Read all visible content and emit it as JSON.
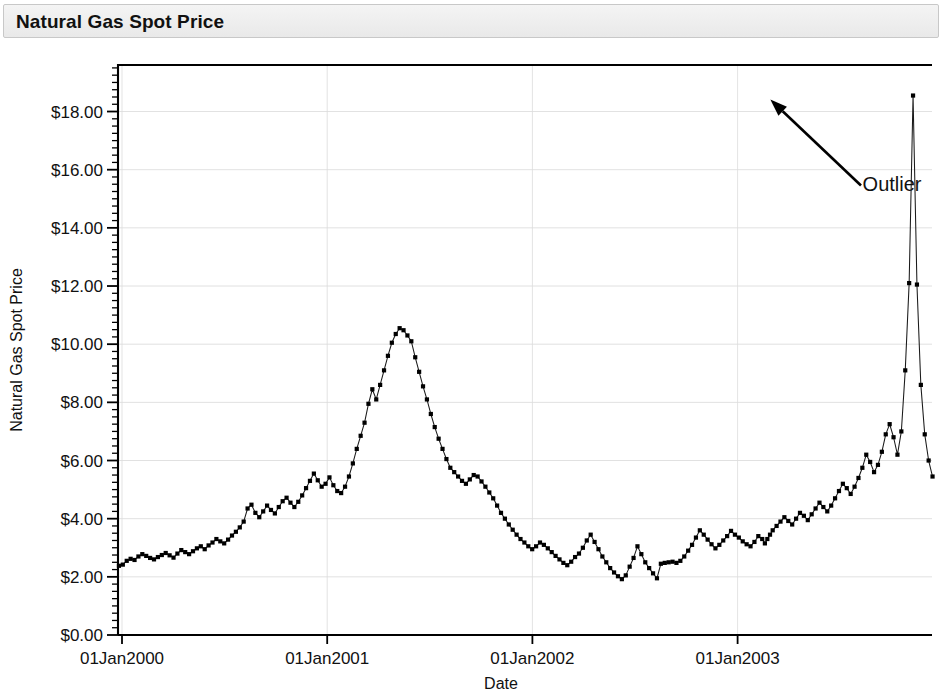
{
  "header": {
    "title": "Natural Gas Spot Price"
  },
  "chart_data": {
    "type": "line",
    "title": "Natural Gas Spot Price",
    "xlabel": "Date",
    "ylabel": "Natural Gas Spot Price",
    "grid": true,
    "legend": null,
    "marker": "square",
    "marker_color": "#000000",
    "line_color": "#1a1a1a",
    "ylim": [
      0.0,
      19.6
    ],
    "ytick_values": [
      0,
      2,
      4,
      6,
      8,
      10,
      12,
      14,
      16,
      18
    ],
    "ytick_labels": [
      "$0.00",
      "$2.00",
      "$4.00",
      "$6.00",
      "$8.00",
      "$10.00",
      "$12.00",
      "$14.00",
      "$16.00",
      "$18.00"
    ],
    "ytick_minor_step": 0.25,
    "xlim": [
      "1999-11-20",
      "2004-01-20"
    ],
    "xtick_labels": [
      "01Jan2000",
      "01Jan2001",
      "01Jan2002",
      "01Jan2003"
    ],
    "xtick_values": [
      2000.0,
      2001.0,
      2002.0,
      2003.0
    ],
    "annotations": [
      {
        "text": "Outlier",
        "points_to_x": 2003.145,
        "points_to_y": 18.55,
        "text_x": 2003.58,
        "text_y": 15.6
      }
    ],
    "x": [
      1999.89,
      1999.909,
      1999.928,
      1999.947,
      1999.966,
      1999.985,
      2000.004,
      2000.023,
      2000.042,
      2000.061,
      2000.08,
      2000.099,
      2000.118,
      2000.137,
      2000.156,
      2000.175,
      2000.194,
      2000.213,
      2000.232,
      2000.251,
      2000.27,
      2000.289,
      2000.308,
      2000.327,
      2000.346,
      2000.365,
      2000.384,
      2000.403,
      2000.422,
      2000.441,
      2000.46,
      2000.479,
      2000.498,
      2000.517,
      2000.536,
      2000.555,
      2000.574,
      2000.593,
      2000.612,
      2000.631,
      2000.65,
      2000.669,
      2000.688,
      2000.707,
      2000.726,
      2000.745,
      2000.764,
      2000.783,
      2000.802,
      2000.821,
      2000.84,
      2000.859,
      2000.878,
      2000.897,
      2000.916,
      2000.935,
      2000.954,
      2000.973,
      2000.992,
      2001.011,
      2001.03,
      2001.049,
      2001.068,
      2001.087,
      2001.106,
      2001.125,
      2001.144,
      2001.163,
      2001.182,
      2001.201,
      2001.22,
      2001.239,
      2001.258,
      2001.277,
      2001.296,
      2001.315,
      2001.334,
      2001.353,
      2001.372,
      2001.391,
      2001.41,
      2001.429,
      2001.448,
      2001.467,
      2001.486,
      2001.505,
      2001.524,
      2001.543,
      2001.562,
      2001.581,
      2001.6,
      2001.619,
      2001.638,
      2001.657,
      2001.676,
      2001.695,
      2001.714,
      2001.733,
      2001.752,
      2001.771,
      2001.79,
      2001.809,
      2001.828,
      2001.847,
      2001.866,
      2001.885,
      2001.904,
      2001.923,
      2001.942,
      2001.961,
      2001.98,
      2001.999,
      2002.018,
      2002.037,
      2002.056,
      2002.075,
      2002.094,
      2002.113,
      2002.132,
      2002.151,
      2002.17,
      2002.189,
      2002.208,
      2002.227,
      2002.246,
      2002.265,
      2002.284,
      2002.303,
      2002.322,
      2002.341,
      2002.36,
      2002.379,
      2002.398,
      2002.417,
      2002.436,
      2002.455,
      2002.474,
      2002.493,
      2002.512,
      2002.531,
      2002.55,
      2002.569,
      2002.588,
      2002.607,
      2002.626,
      2002.645,
      2002.664,
      2002.683,
      2002.702,
      2002.721,
      2002.74,
      2002.759,
      2002.778,
      2002.797,
      2002.816,
      2002.835,
      2002.854,
      2002.873,
      2002.892,
      2002.911,
      2002.93,
      2002.949,
      2002.968,
      2002.987,
      2003.006,
      2003.025,
      2003.044,
      2003.063,
      2003.082,
      2003.101,
      2003.12,
      2003.133,
      2003.145,
      2003.158,
      2003.171,
      2003.19,
      2003.209,
      2003.228,
      2003.247,
      2003.266,
      2003.285,
      2003.304,
      2003.323,
      2003.342,
      2003.361,
      2003.38,
      2003.399,
      2003.418,
      2003.437,
      2003.456,
      2003.475,
      2003.494,
      2003.513,
      2003.532,
      2003.551,
      2003.57,
      2003.589,
      2003.608,
      2003.627,
      2003.646,
      2003.665,
      2003.684,
      2003.703,
      2003.722,
      2003.741,
      2003.76,
      2003.779,
      2003.798,
      2003.817,
      2003.836,
      2003.855,
      2003.874,
      2003.893,
      2003.912,
      2003.931,
      2003.95,
      2003.969,
      2003.988,
      2004.007,
      2004.026,
      2004.045
    ],
    "y": [
      2.2,
      2.32,
      2.4,
      2.35,
      2.28,
      2.38,
      2.42,
      2.55,
      2.62,
      2.58,
      2.7,
      2.78,
      2.72,
      2.65,
      2.6,
      2.68,
      2.75,
      2.82,
      2.74,
      2.66,
      2.8,
      2.92,
      2.85,
      2.78,
      2.88,
      2.98,
      3.05,
      2.95,
      3.08,
      3.18,
      3.3,
      3.22,
      3.15,
      3.28,
      3.42,
      3.55,
      3.7,
      3.9,
      4.35,
      4.48,
      4.2,
      4.05,
      4.25,
      4.45,
      4.3,
      4.18,
      4.4,
      4.6,
      4.72,
      4.55,
      4.4,
      4.58,
      4.8,
      5.05,
      5.3,
      5.55,
      5.32,
      5.1,
      5.2,
      5.42,
      5.15,
      4.95,
      4.88,
      5.1,
      5.45,
      5.9,
      6.4,
      6.85,
      7.3,
      7.95,
      8.45,
      8.1,
      8.6,
      9.1,
      9.6,
      10.05,
      10.35,
      10.55,
      10.48,
      10.3,
      10.1,
      9.55,
      9.05,
      8.55,
      8.1,
      7.6,
      7.15,
      6.75,
      6.4,
      6.05,
      5.75,
      5.6,
      5.45,
      5.3,
      5.2,
      5.35,
      5.5,
      5.45,
      5.28,
      5.1,
      4.9,
      4.7,
      4.45,
      4.2,
      4.0,
      3.8,
      3.62,
      3.45,
      3.3,
      3.18,
      3.05,
      2.95,
      3.05,
      3.18,
      3.1,
      2.98,
      2.85,
      2.72,
      2.6,
      2.48,
      2.4,
      2.52,
      2.68,
      2.8,
      3.0,
      3.25,
      3.45,
      3.2,
      2.95,
      2.7,
      2.5,
      2.3,
      2.15,
      2.02,
      1.92,
      2.05,
      2.35,
      2.65,
      3.05,
      2.78,
      2.5,
      2.3,
      2.12,
      1.95,
      2.45,
      2.48,
      2.5,
      2.52,
      2.48,
      2.55,
      2.7,
      2.9,
      3.1,
      3.35,
      3.6,
      3.45,
      3.28,
      3.12,
      2.98,
      3.1,
      3.25,
      3.4,
      3.58,
      3.45,
      3.35,
      3.22,
      3.12,
      3.05,
      3.2,
      3.4,
      3.3,
      3.15,
      3.3,
      3.45,
      3.6,
      3.75,
      3.9,
      4.05,
      3.92,
      3.8,
      4.0,
      4.2,
      4.1,
      3.95,
      4.15,
      4.35,
      4.55,
      4.4,
      4.25,
      4.45,
      4.7,
      4.95,
      5.2,
      5.05,
      4.85,
      5.1,
      5.4,
      5.75,
      6.2,
      5.95,
      5.6,
      5.85,
      6.3,
      6.9,
      7.25,
      6.8,
      6.2,
      7.0,
      9.1,
      12.1,
      18.55,
      12.05,
      8.6,
      6.9,
      6.0,
      5.45,
      5.6,
      5.75,
      5.4,
      5.2,
      5.05,
      4.9,
      5.15,
      5.45,
      5.25,
      5.0,
      4.85,
      5.1,
      5.35,
      5.6,
      5.85,
      6.1,
      5.9,
      5.65,
      5.45,
      5.25,
      5.15,
      5.05,
      5.3,
      5.55,
      5.4,
      5.2,
      5.0,
      4.85,
      4.75,
      4.65,
      4.8,
      4.95,
      4.7,
      4.55,
      4.45,
      4.6,
      4.8,
      5.1,
      5.55,
      6.1,
      6.6,
      6.95,
      6.8,
      6.35,
      6.05
    ]
  }
}
